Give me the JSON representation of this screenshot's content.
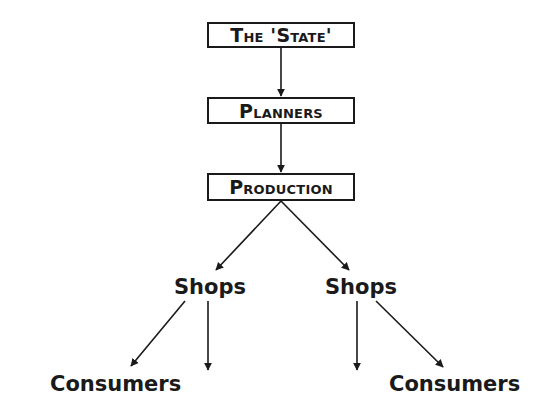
{
  "diagram": {
    "type": "flowchart",
    "nodes": {
      "state": "The 'State'",
      "planners": "Planners",
      "production": "Production",
      "shops_left": "Shops",
      "shops_right": "Shops",
      "consumers_left": "Consumers",
      "consumers_right": "Consumers"
    },
    "edges": [
      {
        "from": "The 'State'",
        "to": "Planners"
      },
      {
        "from": "Planners",
        "to": "Production"
      },
      {
        "from": "Production",
        "to": "Shops (left)"
      },
      {
        "from": "Production",
        "to": "Shops (right)"
      },
      {
        "from": "Shops (left)",
        "to": "Consumers (left)"
      },
      {
        "from": "Shops (left)",
        "to": "unlabeled (down)"
      },
      {
        "from": "Shops (right)",
        "to": "unlabeled (down)"
      },
      {
        "from": "Shops (right)",
        "to": "Consumers (right)"
      }
    ],
    "colors": {
      "line": "#1a1a1a",
      "background": "#ffffff"
    }
  }
}
